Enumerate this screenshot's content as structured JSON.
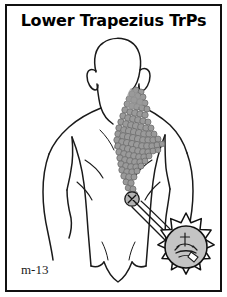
{
  "plate": {
    "title": "Lower Trapezius TrPs",
    "code": "m-13",
    "border_color": "#111111",
    "background": "#ffffff"
  },
  "figure": {
    "name": "posterior-human-torso",
    "view": "posterior",
    "outline_color": "#1a1a1a"
  },
  "referred_pain": {
    "name": "stipple-pain-pattern",
    "label": "referred pain zone stipple",
    "dot_fill": "#9a9a9a",
    "dot_stroke": "#6d6d6d",
    "dot_count": 96,
    "dots": [
      [
        131,
        86,
        3.0
      ],
      [
        136,
        88,
        3.0
      ],
      [
        127,
        90,
        3.0
      ],
      [
        133,
        92,
        3.2
      ],
      [
        138,
        93,
        3.0
      ],
      [
        124,
        95,
        3.0
      ],
      [
        129,
        96,
        3.2
      ],
      [
        135,
        98,
        3.2
      ],
      [
        140,
        99,
        3.0
      ],
      [
        122,
        100,
        3.0
      ],
      [
        127,
        102,
        3.2
      ],
      [
        132,
        103,
        3.2
      ],
      [
        137,
        104,
        3.2
      ],
      [
        142,
        105,
        3.0
      ],
      [
        120,
        106,
        3.2
      ],
      [
        125,
        108,
        3.2
      ],
      [
        130,
        109,
        3.4
      ],
      [
        135,
        110,
        3.2
      ],
      [
        140,
        111,
        3.2
      ],
      [
        118,
        112,
        3.2
      ],
      [
        123,
        114,
        3.4
      ],
      [
        128,
        115,
        3.4
      ],
      [
        133,
        116,
        3.4
      ],
      [
        138,
        117,
        3.2
      ],
      [
        143,
        118,
        3.0
      ],
      [
        116,
        118,
        3.2
      ],
      [
        121,
        120,
        3.4
      ],
      [
        126,
        121,
        3.4
      ],
      [
        131,
        122,
        3.6
      ],
      [
        136,
        123,
        3.4
      ],
      [
        141,
        124,
        3.2
      ],
      [
        146,
        124,
        3.0
      ],
      [
        114,
        124,
        3.2
      ],
      [
        119,
        126,
        3.4
      ],
      [
        124,
        127,
        3.6
      ],
      [
        129,
        128,
        3.6
      ],
      [
        134,
        129,
        3.6
      ],
      [
        139,
        130,
        3.4
      ],
      [
        144,
        130,
        3.2
      ],
      [
        149,
        130,
        3.0
      ],
      [
        113,
        130,
        3.2
      ],
      [
        118,
        132,
        3.4
      ],
      [
        123,
        133,
        3.6
      ],
      [
        128,
        134,
        3.6
      ],
      [
        133,
        135,
        3.6
      ],
      [
        138,
        136,
        3.4
      ],
      [
        143,
        136,
        3.2
      ],
      [
        148,
        136,
        3.2
      ],
      [
        153,
        135,
        3.0
      ],
      [
        112,
        136,
        3.2
      ],
      [
        117,
        138,
        3.4
      ],
      [
        122,
        139,
        3.6
      ],
      [
        127,
        140,
        3.6
      ],
      [
        132,
        141,
        3.6
      ],
      [
        137,
        142,
        3.4
      ],
      [
        142,
        142,
        3.4
      ],
      [
        147,
        142,
        3.2
      ],
      [
        152,
        141,
        3.0
      ],
      [
        157,
        140,
        2.8
      ],
      [
        113,
        142,
        3.2
      ],
      [
        118,
        144,
        3.4
      ],
      [
        123,
        145,
        3.6
      ],
      [
        128,
        146,
        3.6
      ],
      [
        133,
        147,
        3.4
      ],
      [
        138,
        148,
        3.4
      ],
      [
        143,
        148,
        3.2
      ],
      [
        148,
        147,
        3.0
      ],
      [
        153,
        146,
        2.8
      ],
      [
        114,
        148,
        3.2
      ],
      [
        119,
        150,
        3.4
      ],
      [
        124,
        151,
        3.4
      ],
      [
        129,
        152,
        3.4
      ],
      [
        134,
        153,
        3.4
      ],
      [
        139,
        153,
        3.2
      ],
      [
        144,
        152,
        3.0
      ],
      [
        115,
        154,
        3.2
      ],
      [
        120,
        156,
        3.4
      ],
      [
        125,
        157,
        3.4
      ],
      [
        130,
        158,
        3.4
      ],
      [
        135,
        158,
        3.2
      ],
      [
        140,
        157,
        3.0
      ],
      [
        116,
        160,
        3.2
      ],
      [
        121,
        162,
        3.4
      ],
      [
        126,
        163,
        3.4
      ],
      [
        131,
        163,
        3.2
      ],
      [
        136,
        162,
        3.0
      ],
      [
        117,
        166,
        3.2
      ],
      [
        122,
        168,
        3.4
      ],
      [
        127,
        168,
        3.2
      ],
      [
        132,
        167,
        3.0
      ],
      [
        119,
        172,
        3.2
      ],
      [
        124,
        173,
        3.4
      ],
      [
        129,
        173,
        3.0
      ],
      [
        121,
        178,
        3.0
      ],
      [
        126,
        179,
        3.2
      ],
      [
        123,
        184,
        2.8
      ],
      [
        128,
        185,
        3.0
      ],
      [
        125,
        190,
        2.6
      ],
      [
        130,
        190,
        2.6
      ]
    ]
  },
  "trigger_point": {
    "name": "trigger-point-marker",
    "label": "X-in-circle trigger point marker",
    "x": 127,
    "y": 195,
    "radius": 6.5
  },
  "magnifier": {
    "name": "starburst-magnifier",
    "label": "starburst detail callout of trigger point",
    "center_x": 181,
    "center_y": 243,
    "outer_radius": 34,
    "inner_radius": 21,
    "points": 14,
    "fill": "#c9c9c9",
    "stroke": "#111111",
    "leader_lines": 3
  },
  "icons": {
    "starburst": "starburst-icon",
    "trigger_point": "x-circle-icon",
    "needle": "needle-icon"
  }
}
